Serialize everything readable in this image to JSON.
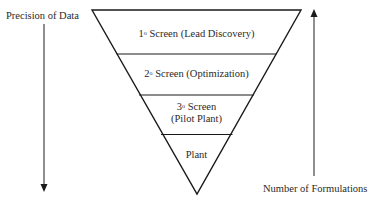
{
  "diagram": {
    "left_axis": {
      "label": "Precision of Data",
      "direction": "down"
    },
    "right_axis": {
      "label": "Number of Formulations",
      "direction": "up"
    },
    "funnel_levels": [
      {
        "order": "1",
        "sup": "o",
        "label": " Screen (Lead Discovery)"
      },
      {
        "order": "2",
        "sup": "o",
        "label": " Screen (Optimization)"
      },
      {
        "order": "3",
        "sup": "o",
        "label": " Screen",
        "line2": "(Pilot Plant)"
      },
      {
        "label": "Plant"
      }
    ],
    "colors": {
      "stroke": "#1a1a1a",
      "text": "#2a2a2a",
      "background": "#ffffff"
    }
  }
}
